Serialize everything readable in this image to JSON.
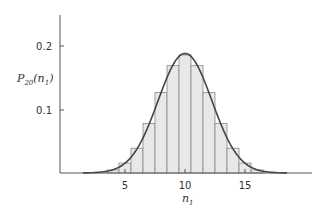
{
  "chart_data": {
    "type": "bar",
    "title": "",
    "subtype": "histogram with overlaid normal curve",
    "xlabel": "n1",
    "ylabel": "P20(n1)",
    "x": [
      3,
      4,
      5,
      6,
      7,
      8,
      9,
      10,
      11,
      12,
      13,
      14,
      15,
      16,
      17
    ],
    "values": [
      0.0011,
      0.0046,
      0.0148,
      0.037,
      0.0739,
      0.1201,
      0.1602,
      0.1762,
      0.1602,
      0.1201,
      0.0739,
      0.037,
      0.0148,
      0.0046,
      0.0011
    ],
    "x_ticks": [
      5,
      10,
      15
    ],
    "y_ticks": [
      0.1,
      0.2
    ],
    "xlim": [
      -1,
      21
    ],
    "ylim": [
      0,
      0.25
    ],
    "grid": false,
    "legend": null,
    "overlay": {
      "type": "line",
      "name": "Gaussian approximation",
      "mean": 10,
      "sd": 2.236
    },
    "colors": {
      "bar_fill": "#e8e8e8",
      "bar_edge": "#888888",
      "curve": "#444444",
      "axis": "#555555"
    }
  },
  "labels": {
    "x_tick_5": "5",
    "x_tick_10": "10",
    "x_tick_15": "15",
    "y_tick_01": "0.1",
    "y_tick_02": "0.2",
    "x_title_main": "n",
    "x_title_sub": "1",
    "y_title_main": "P",
    "y_title_sub1": "20",
    "y_title_open": "(n",
    "y_title_sub2": "1",
    "y_title_close": ")"
  }
}
